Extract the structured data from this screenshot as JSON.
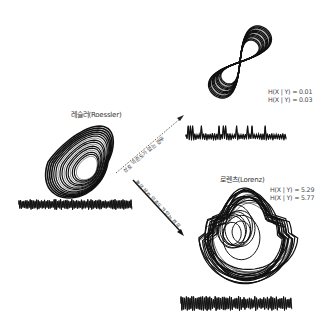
{
  "roessler": {
    "title": "레슬러(Roessler)"
  },
  "lorenz_top": {
    "metrics": [
      "H(X | Y) = 0.01",
      "H(X | Y) = 0.03"
    ]
  },
  "lorenz_bottom": {
    "title": "로렌츠(Lorenz)",
    "metrics": [
      "H(X | Y) = 5.29",
      "H(X | Y) = 5.77"
    ]
  },
  "arrows": {
    "no_dependence": "상호 의존도가 없는 경우",
    "high_dependence": "높은 상호 의존도가 있는 경우"
  },
  "colors": {
    "ink": "#111111",
    "text": "#333333",
    "background": "#ffffff"
  }
}
